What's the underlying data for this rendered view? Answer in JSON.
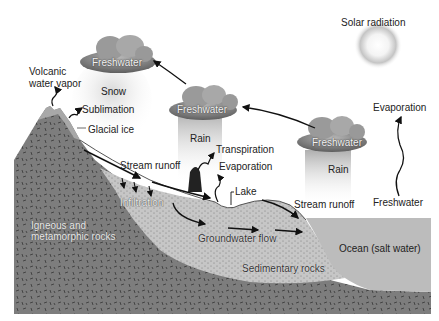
{
  "diagram": {
    "colors": {
      "igneous_rock": "#7b7b7b",
      "sedimentary": "#c9c9c9",
      "ocean": "#b9b9b9",
      "cloud": "#8a8a8a",
      "sun_glow": "#bdbdbd",
      "arrow": "#111111",
      "background": "#ffffff"
    },
    "labels": {
      "solar_radiation": "Solar radiation",
      "cloud_left": "Freshwater",
      "cloud_middle": "Freshwater",
      "cloud_right": "Freshwater",
      "snow": "Snow",
      "rain_middle": "Rain",
      "rain_right": "Rain",
      "volcanic_line1": "Volcanic",
      "volcanic_line2": "water vapor",
      "sublimation": "Sublimation",
      "glacial_ice": "Glacial ice",
      "stream_runoff_left": "Stream runoff",
      "transpiration": "Transpiration",
      "evaporation_land": "Evaporation",
      "lake": "Lake",
      "infiltration": "Infiltration",
      "groundwater_flow": "Groundwater flow",
      "stream_runoff_right": "Stream runoff",
      "evaporation_ocean": "Evaporation",
      "freshwater_ocean": "Freshwater",
      "igneous_line1": "Igneous and",
      "igneous_line2": "metamorphic rocks",
      "ocean": "Ocean (salt water)",
      "sedimentary": "Sedimentary rocks"
    }
  }
}
